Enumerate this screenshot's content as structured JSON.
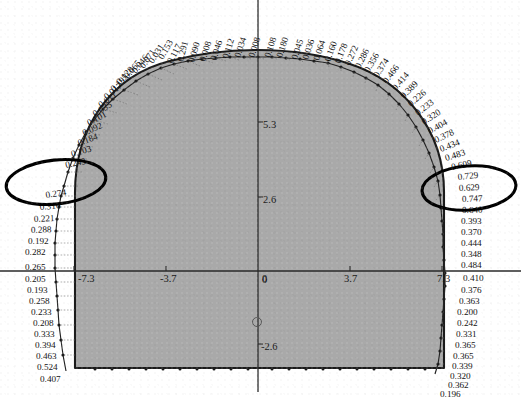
{
  "figure": {
    "fill_color": "#a8a8a8",
    "outline_color": "#1a1a1a",
    "annotation_color": "#000000",
    "label_color": "#111111"
  },
  "axes": {
    "x": {
      "ticks": [
        {
          "label": "-7.3",
          "value": -7.3
        },
        {
          "label": "-3.7",
          "value": -3.7
        },
        {
          "label": "0",
          "value": 0
        },
        {
          "label": "3.7",
          "value": 3.7
        },
        {
          "label": "7.3",
          "value": 7.3
        }
      ]
    },
    "y": {
      "ticks": [
        {
          "label": "5.3",
          "value": 5.3
        },
        {
          "label": "2.6",
          "value": 2.6
        },
        {
          "label": "0",
          "value": 0
        },
        {
          "label": "-2.6",
          "value": -2.6
        }
      ]
    }
  },
  "annotations": [
    {
      "name": "ellipse-left",
      "cx": 56,
      "cy": 182,
      "rx": 50,
      "ry": 22,
      "rotate": -6
    },
    {
      "name": "ellipse-right",
      "cx": 469,
      "cy": 188,
      "rx": 47,
      "ry": 22,
      "rotate": -4
    }
  ],
  "origin_marker": {
    "name": "origin-circle-marker",
    "cx": 257,
    "cy": 322,
    "r": 4.5
  },
  "chart_data": {
    "type": "scatter",
    "xlabel": "",
    "ylabel": "",
    "xlim": [
      -9.2,
      9.2
    ],
    "ylim": [
      -4.2,
      7.6
    ],
    "grid": false,
    "legend": null,
    "x_ticks": [
      -7.3,
      -3.7,
      0,
      3.7,
      7.3
    ],
    "y_ticks": [
      5.3,
      2.6,
      0,
      -2.6
    ],
    "series": [
      {
        "name": "radial deformation (crown, right half, clockwise from apex)",
        "values": [
          0.108,
          0.18,
          0.045,
          0.036,
          0.064,
          0.16,
          0.178,
          0.272,
          0.286,
          0.356,
          0.374,
          0.466,
          0.414,
          0.389,
          0.226,
          0.233,
          0.32,
          0.404,
          0.378,
          0.434,
          0.483,
          0.609,
          0.729,
          0.629,
          0.747,
          0.64
        ]
      },
      {
        "name": "radial deformation (right sidewall, top to bottom)",
        "values": [
          0.393,
          0.37,
          0.444,
          0.348,
          0.484,
          0.41,
          0.376,
          0.363,
          0.2,
          0.242,
          0.331,
          0.365,
          0.365,
          0.339,
          0.32,
          0.362,
          0.196
        ]
      },
      {
        "name": "radial deformation (crown, left half, counter-clockwise from apex)",
        "values": [
          0.008,
          0.034,
          0.112,
          0.046,
          0.008,
          0.09,
          0.291,
          0.117,
          0.153,
          0.031,
          0.071,
          0.046,
          0.065,
          0.128,
          0.195,
          0.017,
          0.011,
          0.035,
          0.101,
          0.092,
          0.184,
          0.103,
          0.243
        ]
      },
      {
        "name": "radial deformation (left sidewall, top to bottom)",
        "values": [
          0.274,
          0.316,
          0.221,
          0.288,
          0.192,
          0.282,
          0.265,
          0.205,
          0.193,
          0.258,
          0.233,
          0.208,
          0.333,
          0.394,
          0.463,
          0.524,
          0.407
        ]
      }
    ]
  },
  "labels": {
    "crown_right": [
      {
        "t": "0.108",
        "x": 270,
        "y": 58,
        "r": -72
      },
      {
        "t": "0.180",
        "x": 282,
        "y": 58,
        "r": -72
      },
      {
        "t": "0.045",
        "x": 297,
        "y": 60,
        "r": -72
      },
      {
        "t": "0.036",
        "x": 308,
        "y": 60,
        "r": -72
      },
      {
        "t": "0.064",
        "x": 319,
        "y": 61,
        "r": -72
      },
      {
        "t": "0.160",
        "x": 330,
        "y": 62,
        "r": -70
      },
      {
        "t": "0.178",
        "x": 340,
        "y": 64,
        "r": -68
      },
      {
        "t": "0.272",
        "x": 350,
        "y": 66,
        "r": -66
      },
      {
        "t": "0.286",
        "x": 360,
        "y": 69,
        "r": -63
      },
      {
        "t": "0.356",
        "x": 369,
        "y": 73,
        "r": -60
      },
      {
        "t": "0.374",
        "x": 378,
        "y": 78,
        "r": -57
      },
      {
        "t": "0.466",
        "x": 387,
        "y": 84,
        "r": -53
      },
      {
        "t": "0.414",
        "x": 396,
        "y": 91,
        "r": -49
      },
      {
        "t": "0.389",
        "x": 404,
        "y": 99,
        "r": -45
      },
      {
        "t": "0.226",
        "x": 411,
        "y": 107,
        "r": -41
      },
      {
        "t": "0.233",
        "x": 418,
        "y": 116,
        "r": -37
      },
      {
        "t": "0.320",
        "x": 424,
        "y": 125,
        "r": -33
      },
      {
        "t": "0.404",
        "x": 430,
        "y": 134,
        "r": -29
      },
      {
        "t": "0.378",
        "x": 436,
        "y": 143,
        "r": -25
      },
      {
        "t": "0.434",
        "x": 441,
        "y": 152,
        "r": -21
      },
      {
        "t": "0.483",
        "x": 446,
        "y": 161,
        "r": -17
      },
      {
        "t": "0.609",
        "x": 452,
        "y": 170,
        "r": -13
      },
      {
        "t": "0.729",
        "x": 458,
        "y": 180,
        "r": -6
      },
      {
        "t": "0.629",
        "x": 459,
        "y": 191,
        "r": -3
      },
      {
        "t": "0.747",
        "x": 462,
        "y": 202,
        "r": -2
      },
      {
        "t": "0.640",
        "x": 462,
        "y": 213,
        "r": -1
      }
    ],
    "right_wall": [
      {
        "t": "0.393",
        "x": 461,
        "y": 224,
        "r": 0
      },
      {
        "t": "0.370",
        "x": 461,
        "y": 235,
        "r": 0
      },
      {
        "t": "0.444",
        "x": 461,
        "y": 246,
        "r": 0
      },
      {
        "t": "0.348",
        "x": 461,
        "y": 257,
        "r": 0
      },
      {
        "t": "0.484",
        "x": 461,
        "y": 268,
        "r": 0
      },
      {
        "t": "0.410",
        "x": 463,
        "y": 281,
        "r": 0
      },
      {
        "t": "0.376",
        "x": 461,
        "y": 293,
        "r": 0
      },
      {
        "t": "0.363",
        "x": 459,
        "y": 304,
        "r": 0
      },
      {
        "t": "0.200",
        "x": 457,
        "y": 315,
        "r": 0
      },
      {
        "t": "0.242",
        "x": 457,
        "y": 326,
        "r": 0
      },
      {
        "t": "0.331",
        "x": 456,
        "y": 337,
        "r": 0
      },
      {
        "t": "0.365",
        "x": 455,
        "y": 348,
        "r": 0
      },
      {
        "t": "0.365",
        "x": 453,
        "y": 359,
        "r": 0
      },
      {
        "t": "0.339",
        "x": 452,
        "y": 369,
        "r": 0
      },
      {
        "t": "0.320",
        "x": 450,
        "y": 379,
        "r": 0
      },
      {
        "t": "0.362",
        "x": 448,
        "y": 388,
        "r": 0
      },
      {
        "t": "0.196",
        "x": 440,
        "y": 397,
        "r": 0
      }
    ],
    "crown_left": [
      {
        "t": "0.008",
        "x": 254,
        "y": 58,
        "r": -72
      },
      {
        "t": "0.034",
        "x": 240,
        "y": 58,
        "r": -72
      },
      {
        "t": "0.112",
        "x": 228,
        "y": 59,
        "r": -72
      },
      {
        "t": "0.046",
        "x": 216,
        "y": 61,
        "r": -72
      },
      {
        "t": "0.008",
        "x": 205,
        "y": 62,
        "r": -72
      },
      {
        "t": "0.090",
        "x": 194,
        "y": 63,
        "r": -74
      },
      {
        "t": "0.291",
        "x": 183,
        "y": 62,
        "r": -76
      },
      {
        "t": "0.117",
        "x": 172,
        "y": 64,
        "r": -62
      },
      {
        "t": "0.153",
        "x": 163,
        "y": 60,
        "r": -60
      },
      {
        "t": "0.031",
        "x": 153,
        "y": 64,
        "r": -57
      },
      {
        "t": "0.071",
        "x": 144,
        "y": 69,
        "r": -55
      },
      {
        "t": "0.046",
        "x": 136,
        "y": 74,
        "r": -52
      },
      {
        "t": "0.065",
        "x": 128,
        "y": 79,
        "r": -50
      },
      {
        "t": "0.128",
        "x": 120,
        "y": 85,
        "r": -47
      },
      {
        "t": "0.195",
        "x": 114,
        "y": 92,
        "r": -44
      },
      {
        "t": "0.017",
        "x": 107,
        "y": 100,
        "r": -40
      },
      {
        "t": "0.011",
        "x": 101,
        "y": 108,
        "r": -36
      },
      {
        "t": "0.035",
        "x": 95,
        "y": 117,
        "r": -32
      },
      {
        "t": "0.101",
        "x": 89,
        "y": 126,
        "r": -28
      },
      {
        "t": "0.092",
        "x": 84,
        "y": 136,
        "r": -24
      },
      {
        "t": "0.184",
        "x": 79,
        "y": 146,
        "r": -20
      },
      {
        "t": "0.103",
        "x": 72,
        "y": 157,
        "r": -16
      },
      {
        "t": "0.243",
        "x": 66,
        "y": 168,
        "r": -12
      }
    ],
    "left_wall": [
      {
        "t": "0.274",
        "x": 46,
        "y": 198,
        "r": -8
      },
      {
        "t": "0.316",
        "x": 40,
        "y": 210,
        "r": -5
      },
      {
        "t": "0.221",
        "x": 34,
        "y": 222,
        "r": -3
      },
      {
        "t": "0.288",
        "x": 31,
        "y": 233,
        "r": -2
      },
      {
        "t": "0.192",
        "x": 28,
        "y": 244,
        "r": 0
      },
      {
        "t": "0.282",
        "x": 25,
        "y": 255,
        "r": 0
      },
      {
        "t": "0.265",
        "x": 25,
        "y": 270,
        "r": 0
      },
      {
        "t": "0.205",
        "x": 25,
        "y": 282,
        "r": 0
      },
      {
        "t": "0.193",
        "x": 27,
        "y": 293,
        "r": 0
      },
      {
        "t": "0.258",
        "x": 29,
        "y": 304,
        "r": 0
      },
      {
        "t": "0.233",
        "x": 31,
        "y": 315,
        "r": 0
      },
      {
        "t": "0.208",
        "x": 33,
        "y": 326,
        "r": 0
      },
      {
        "t": "0.333",
        "x": 34,
        "y": 337,
        "r": 0
      },
      {
        "t": "0.394",
        "x": 35,
        "y": 348,
        "r": 0
      },
      {
        "t": "0.463",
        "x": 36,
        "y": 359,
        "r": 0
      },
      {
        "t": "0.524",
        "x": 37,
        "y": 370,
        "r": 0
      },
      {
        "t": "0.407",
        "x": 40,
        "y": 382,
        "r": 0
      }
    ]
  }
}
